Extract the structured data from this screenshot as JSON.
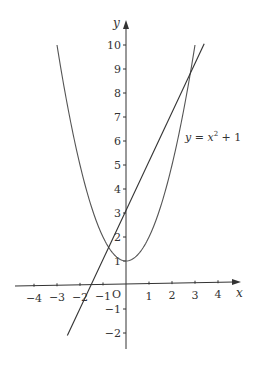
{
  "chart_data": {
    "type": "line",
    "title": "",
    "xlabel": "x",
    "ylabel": "y",
    "origin_label": "O",
    "xlim": [
      -4.7,
      4.5
    ],
    "ylim": [
      -2.7,
      11
    ],
    "grid": false,
    "x_ticks": [
      -4,
      -3,
      -2,
      -1,
      1,
      2,
      3,
      4
    ],
    "x_tick_labels": [
      "−4",
      "−3",
      "−2",
      "−1",
      "1",
      "2",
      "3",
      "4"
    ],
    "y_ticks": [
      -2,
      -1,
      1,
      2,
      3,
      4,
      5,
      6,
      7,
      8,
      9,
      10
    ],
    "y_tick_labels": [
      "−2",
      "−1",
      "1",
      "2",
      "3",
      "4",
      "5",
      "6",
      "7",
      "8",
      "9",
      "10"
    ],
    "series": [
      {
        "name": "y = x^2 + 1",
        "label": "y = x² + 1",
        "kind": "parabola",
        "equation": "y = x^2 + 1",
        "x_range": [
          -3,
          3
        ],
        "x": [
          -3,
          -2,
          -1,
          0,
          1,
          2,
          3
        ],
        "y": [
          10,
          5,
          2,
          1,
          2,
          5,
          10
        ]
      },
      {
        "name": "line",
        "label": "",
        "kind": "line",
        "equation": "y = 2x + 3",
        "x_range": [
          -2.55,
          3.4
        ],
        "x": [
          -2.55,
          -1.5,
          0,
          3.4
        ],
        "y": [
          -2.1,
          0,
          3,
          9.8
        ]
      }
    ],
    "intersections": [
      {
        "x": -0.73,
        "y": 1.54
      },
      {
        "x": 2.73,
        "y": 8.46
      }
    ]
  },
  "labels": {
    "x_axis": "x",
    "y_axis": "y",
    "origin": "O",
    "curve_y": "y = x",
    "curve_exp": "2",
    "curve_tail": " + 1"
  }
}
